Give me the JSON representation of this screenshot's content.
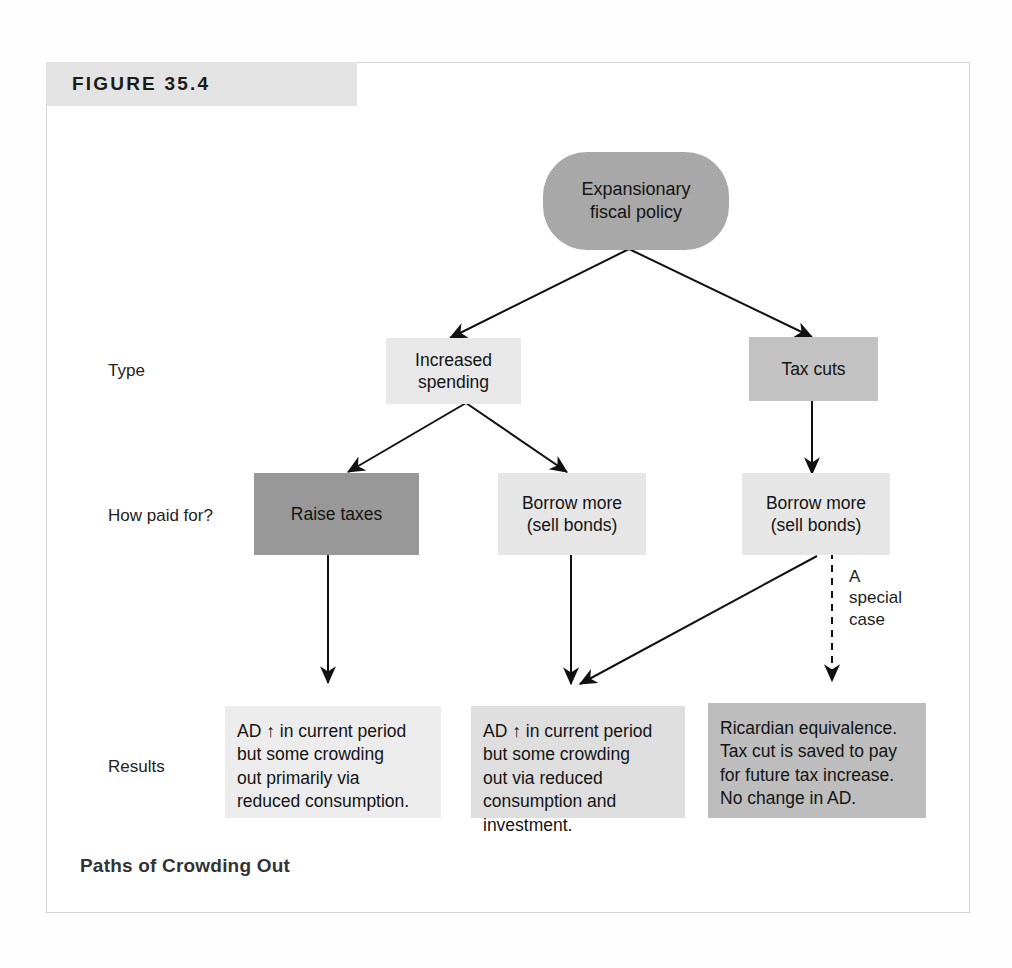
{
  "figure": {
    "header_label": "Figure 35.4",
    "caption": "Paths of Crowding Out"
  },
  "row_labels": [
    {
      "id": "type",
      "text": "Type"
    },
    {
      "id": "how-paid-for",
      "text": "How paid for?"
    },
    {
      "id": "results",
      "text": "Results"
    }
  ],
  "nodes": {
    "root": {
      "id": "expansionary-fiscal-policy",
      "text": "Expansionary\nfiscal policy",
      "shape": "pill",
      "fill": "#a8a8a8"
    },
    "type_row": [
      {
        "id": "increased-spending",
        "text": "Increased\nspending",
        "shape": "rect",
        "fill": "#e8e8e8"
      },
      {
        "id": "tax-cuts",
        "text": "Tax cuts",
        "shape": "rect",
        "fill": "#c2c2c2"
      }
    ],
    "paid_row": [
      {
        "id": "raise-taxes",
        "text": "Raise taxes",
        "shape": "rect",
        "fill": "#989898"
      },
      {
        "id": "borrow-more-spending",
        "text": "Borrow more\n(sell bonds)",
        "shape": "rect",
        "fill": "#e6e6e6"
      },
      {
        "id": "borrow-more-taxcut",
        "text": "Borrow more\n(sell bonds)",
        "shape": "rect",
        "fill": "#e6e6e6"
      }
    ],
    "results_row": [
      {
        "id": "result-raise-taxes",
        "text": "AD ↑ in current period\nbut some crowding\nout primarily via\nreduced consumption.",
        "shape": "rect",
        "fill": "#ececec"
      },
      {
        "id": "result-borrow-spending",
        "text": "AD ↑ in current period\nbut some crowding\nout via reduced\nconsumption and\ninvestment.",
        "shape": "rect",
        "fill": "#dedede"
      },
      {
        "id": "result-ricardian",
        "text": "Ricardian equivalence.\nTax cut is saved to pay\nfor future tax increase.\nNo change in AD.",
        "shape": "rect",
        "fill": "#bdbdbd"
      }
    ]
  },
  "annotations": {
    "special_case": "A\nspecial\ncase"
  },
  "colors": {
    "frame_border": "#d5d5d5",
    "header_band": "#e3e3e3",
    "arrow_stroke": "#111111",
    "text": "#141414"
  }
}
